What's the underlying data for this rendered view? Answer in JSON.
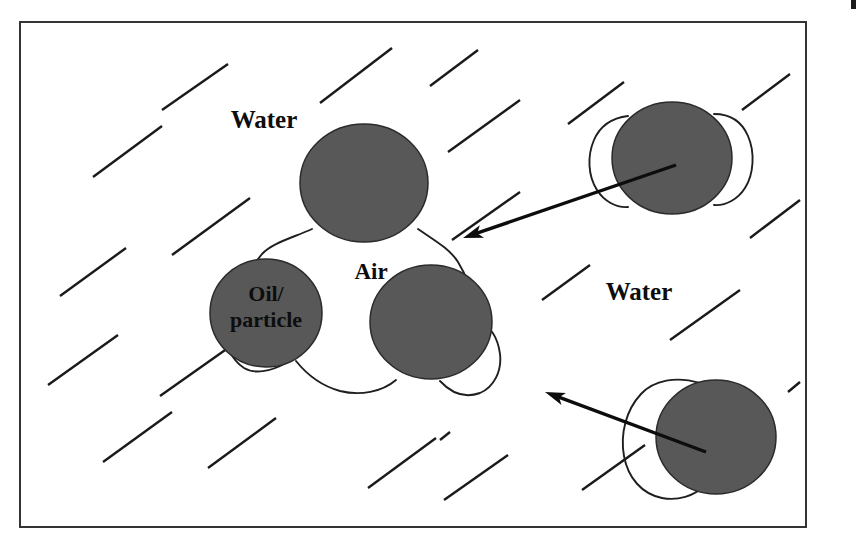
{
  "figure": {
    "frame": {
      "x": 20,
      "y": 22,
      "width": 786,
      "height": 505,
      "stroke_color": "#2b2b2b"
    },
    "canvas": {
      "width": 861,
      "height": 543,
      "background": "#ffffff"
    }
  },
  "colors": {
    "particle_fill": "#585858",
    "particle_stroke": "#2a2a2a",
    "bubble_outline": "#1f1f1f",
    "hatch": "#1a1a1a",
    "arrow": "#0d0d0d",
    "text": "#0d0d0d",
    "background": "#ffffff"
  },
  "labels": {
    "water_top_left": "Water",
    "water_right": "Water",
    "air": "Air",
    "oil_particle_line1": "Oil/",
    "oil_particle_line2": "particle"
  },
  "label_positions": {
    "water_top_left": {
      "x": 264,
      "y": 128
    },
    "water_right": {
      "x": 639,
      "y": 300
    },
    "air": {
      "x": 371,
      "y": 279
    },
    "oil_particle_line1": {
      "x": 266,
      "y": 301
    },
    "oil_particle_line2": {
      "x": 266,
      "y": 327
    }
  },
  "particles": [
    {
      "name": "cluster-particle-top",
      "cx": 364,
      "cy": 183,
      "rx": 64,
      "ry": 59
    },
    {
      "name": "cluster-particle-left",
      "cx": 266,
      "cy": 313,
      "rx": 56,
      "ry": 54
    },
    {
      "name": "cluster-particle-right",
      "cx": 431,
      "cy": 322,
      "rx": 61,
      "ry": 57
    },
    {
      "name": "free-particle-top-right",
      "cx": 672,
      "cy": 158,
      "rx": 60,
      "ry": 56
    },
    {
      "name": "free-particle-bottom-right",
      "cx": 716,
      "cy": 437,
      "rx": 60,
      "ry": 57
    }
  ],
  "arrows": [
    {
      "name": "arrow-upper",
      "from": {
        "x": 676,
        "y": 165
      },
      "to": {
        "x": 463,
        "y": 238
      },
      "direction": "points-left-down-toward-cluster"
    },
    {
      "name": "arrow-lower",
      "from": {
        "x": 706,
        "y": 452
      },
      "to": {
        "x": 545,
        "y": 392
      },
      "direction": "points-left-up-toward-cluster"
    }
  ],
  "hatch_lines": {
    "count": 22,
    "angle_deg": -40,
    "meaning": "water shading",
    "segments": [
      {
        "x1": 162,
        "y1": 110,
        "x2": 228,
        "y2": 64
      },
      {
        "x1": 320,
        "y1": 103,
        "x2": 392,
        "y2": 48
      },
      {
        "x1": 430,
        "y1": 86,
        "x2": 478,
        "y2": 50
      },
      {
        "x1": 93,
        "y1": 177,
        "x2": 162,
        "y2": 126
      },
      {
        "x1": 448,
        "y1": 152,
        "x2": 520,
        "y2": 100
      },
      {
        "x1": 568,
        "y1": 124,
        "x2": 624,
        "y2": 82
      },
      {
        "x1": 742,
        "y1": 110,
        "x2": 790,
        "y2": 74
      },
      {
        "x1": 172,
        "y1": 255,
        "x2": 250,
        "y2": 198
      },
      {
        "x1": 60,
        "y1": 296,
        "x2": 126,
        "y2": 248
      },
      {
        "x1": 452,
        "y1": 240,
        "x2": 520,
        "y2": 192
      },
      {
        "x1": 750,
        "y1": 238,
        "x2": 800,
        "y2": 200
      },
      {
        "x1": 542,
        "y1": 300,
        "x2": 590,
        "y2": 265
      },
      {
        "x1": 670,
        "y1": 340,
        "x2": 740,
        "y2": 290
      },
      {
        "x1": 48,
        "y1": 385,
        "x2": 118,
        "y2": 335
      },
      {
        "x1": 160,
        "y1": 396,
        "x2": 228,
        "y2": 348
      },
      {
        "x1": 103,
        "y1": 462,
        "x2": 172,
        "y2": 412
      },
      {
        "x1": 208,
        "y1": 468,
        "x2": 276,
        "y2": 418
      },
      {
        "x1": 368,
        "y1": 488,
        "x2": 436,
        "y2": 438
      },
      {
        "x1": 444,
        "y1": 500,
        "x2": 508,
        "y2": 455
      },
      {
        "x1": 582,
        "y1": 490,
        "x2": 645,
        "y2": 445
      },
      {
        "x1": 440,
        "y1": 440,
        "x2": 450,
        "y2": 432
      },
      {
        "x1": 788,
        "y1": 392,
        "x2": 800,
        "y2": 382
      }
    ]
  },
  "scan_artifact": {
    "x": 851,
    "y": 0,
    "width": 5,
    "height": 9
  }
}
